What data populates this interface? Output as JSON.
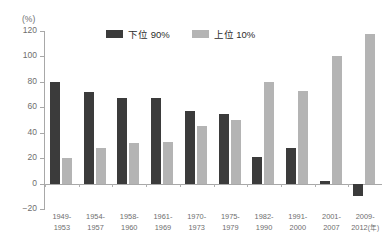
{
  "chart_data": {
    "type": "bar",
    "title": "",
    "xlabel": "年",
    "ylabel": "(%)",
    "ylim": [
      -20,
      120
    ],
    "yticks": [
      120,
      100,
      80,
      60,
      40,
      20,
      0,
      -20
    ],
    "grid": false,
    "legend_position": "top-center",
    "unit_label": "(%)",
    "x_axis_suffix": "(年)",
    "categories": [
      "1949-\n1953",
      "1954-\n1957",
      "1958-\n1960",
      "1961-\n1969",
      "1970-\n1973",
      "1975-\n1979",
      "1982-\n1990",
      "1991-\n2000",
      "2001-\n2007",
      "2009-\n2012"
    ],
    "category_parts": [
      {
        "start": "1949-",
        "end": "1953"
      },
      {
        "start": "1954-",
        "end": "1957"
      },
      {
        "start": "1958-",
        "end": "1960"
      },
      {
        "start": "1961-",
        "end": "1969"
      },
      {
        "start": "1970-",
        "end": "1973"
      },
      {
        "start": "1975-",
        "end": "1979"
      },
      {
        "start": "1982-",
        "end": "1990"
      },
      {
        "start": "1991-",
        "end": "2000"
      },
      {
        "start": "2001-",
        "end": "2007"
      },
      {
        "start": "2009-",
        "end": "2012",
        "suffix": "(年)"
      }
    ],
    "series": [
      {
        "name": "下位 90%",
        "color": "#3b3b3b",
        "values": [
          80,
          72,
          67,
          67,
          57,
          55,
          21,
          28,
          2,
          -10
        ]
      },
      {
        "name": "上位 10%",
        "color": "#b4b4b4",
        "values": [
          20,
          28,
          32,
          33,
          45,
          50,
          80,
          73,
          100,
          118
        ]
      }
    ]
  },
  "legend": {
    "items": [
      {
        "label": "下位 90%",
        "swatch": "dark"
      },
      {
        "label": "上位 10%",
        "swatch": "light"
      }
    ]
  },
  "colors": {
    "dark_series": "#3b3b3b",
    "light_series": "#b4b4b4",
    "axis": "#a8a8a8",
    "text": "#6e6e6e",
    "background": "#ffffff"
  }
}
